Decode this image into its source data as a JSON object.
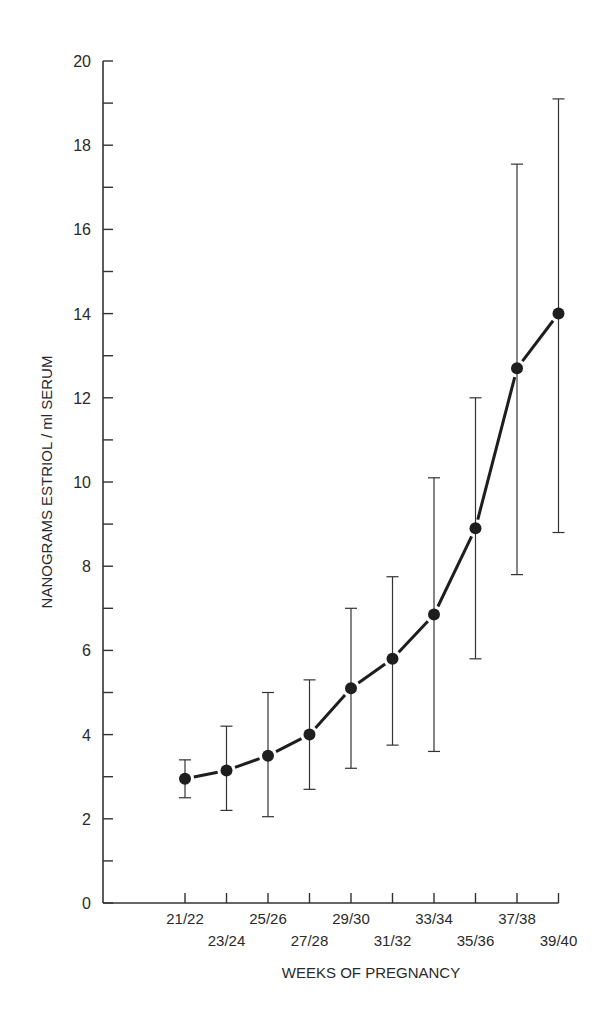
{
  "chart_data": {
    "type": "line",
    "title": "",
    "xlabel": "WEEKS OF PREGNANCY",
    "ylabel": "NANOGRAMS ESTRIOL / ml SERUM",
    "categories": [
      "21/22",
      "23/24",
      "25/26",
      "27/28",
      "29/30",
      "31/32",
      "33/34",
      "35/36",
      "37/38",
      "39/40"
    ],
    "series": [
      {
        "name": "Mean estriol",
        "values": [
          2.95,
          3.15,
          3.5,
          4.0,
          5.1,
          5.8,
          6.85,
          8.9,
          12.7,
          14.0
        ],
        "error_upper": [
          3.4,
          4.2,
          5.0,
          5.3,
          7.0,
          7.75,
          10.1,
          12.0,
          17.55,
          19.1
        ],
        "error_lower": [
          2.5,
          2.2,
          2.05,
          2.7,
          3.2,
          3.75,
          3.6,
          5.8,
          7.8,
          8.8
        ]
      }
    ],
    "ylim": [
      0,
      20
    ],
    "y_ticks": [
      0,
      2,
      4,
      6,
      8,
      10,
      12,
      14,
      16,
      18,
      20
    ],
    "y_minor_ticks": [
      1,
      3,
      5,
      7,
      9,
      11,
      13,
      15,
      17,
      19
    ],
    "grid": false,
    "legend": null,
    "colors": {
      "line": "#1e1e1e",
      "marker": "#1e1e1e",
      "axis": "#333333",
      "background": "#ffffff"
    }
  }
}
